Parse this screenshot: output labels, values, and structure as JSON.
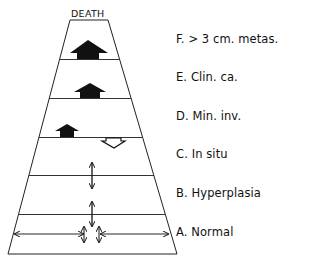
{
  "diagram": {
    "top_label": "DEATH",
    "stages": [
      {
        "id": "F",
        "label": "F. > 3 cm. metas."
      },
      {
        "id": "E",
        "label": "E. Clin. ca."
      },
      {
        "id": "D",
        "label": "D. Min. inv."
      },
      {
        "id": "C",
        "label": "C. In situ"
      },
      {
        "id": "B",
        "label": "B. Hyperplasia"
      },
      {
        "id": "A",
        "label": "A. Normal"
      }
    ],
    "arrows": {
      "F": "large solid up arrow",
      "E": "medium solid up arrow",
      "D": "small solid up arrow, hollow down arrow",
      "C": "vertical double arrow",
      "B": "vertical double arrow",
      "A": "horizontal double arrows and small vertical double arrows"
    },
    "colors": {
      "ink": "#111111",
      "background": "#ffffff"
    }
  }
}
